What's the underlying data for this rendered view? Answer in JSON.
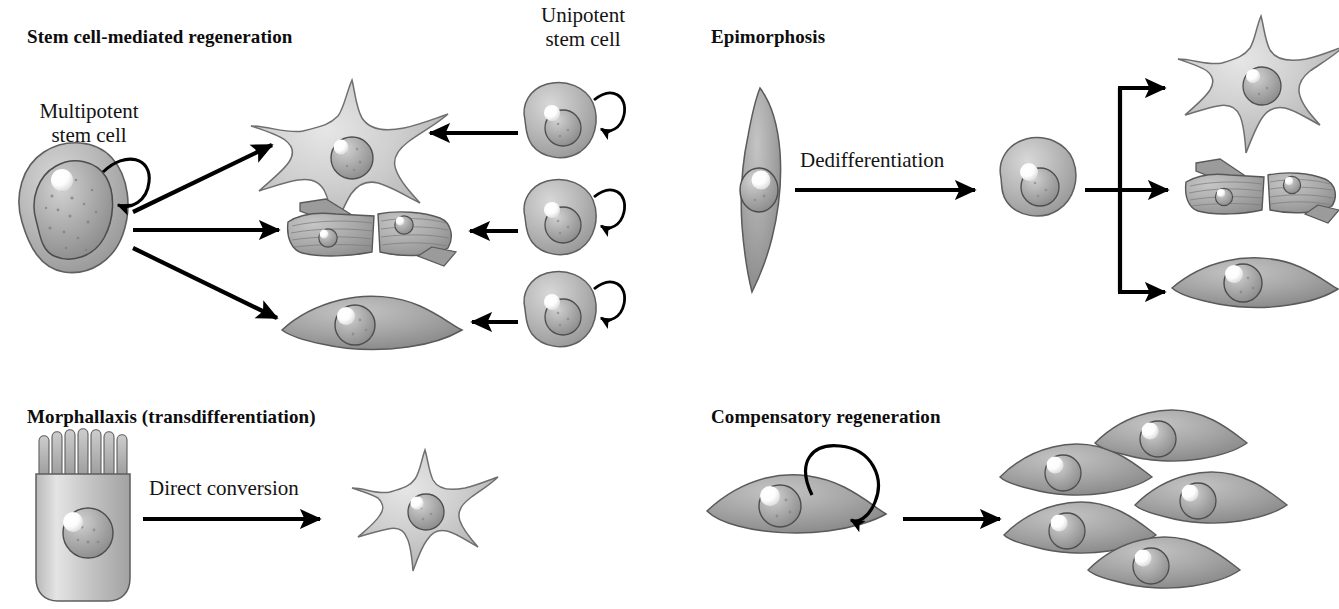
{
  "figure": {
    "type": "biological-schematic",
    "title_visible": false,
    "background_color": "#ffffff",
    "panel_count": 4
  },
  "panels": [
    {
      "id": "stem-cell-mediated-regeneration",
      "heading": "Stem cell-mediated regeneration",
      "labels": [
        {
          "id": "multipotent",
          "text_line1": "Multipotent",
          "text_line2": "stem cell"
        },
        {
          "id": "unipotent",
          "text_line1": "Unipotent",
          "text_line2": "stem cell"
        }
      ],
      "source_cell": {
        "name": "multipotent stem cell",
        "shape": "round",
        "self_renewal_arrow": true
      },
      "output_cells": [
        {
          "name": "neuron",
          "shape": "star"
        },
        {
          "name": "muscle fiber",
          "shape": "striated-fibers"
        },
        {
          "name": "fibroblast",
          "shape": "spindle"
        }
      ],
      "input_cells": [
        {
          "name": "unipotent stem cell",
          "shape": "round",
          "self_renewal_arrow": true
        },
        {
          "name": "unipotent stem cell",
          "shape": "round",
          "self_renewal_arrow": true
        },
        {
          "name": "unipotent stem cell",
          "shape": "round",
          "self_renewal_arrow": true
        }
      ],
      "arrow_count": 6
    },
    {
      "id": "epimorphosis",
      "heading": "Epimorphosis",
      "labels": [
        {
          "id": "dedifferentiation",
          "text_line1": "Dedifferentiation",
          "text_line2": ""
        }
      ],
      "source_cell": {
        "name": "differentiated elongated cell",
        "shape": "vertical-spindle",
        "self_renewal_arrow": false
      },
      "intermediate_cell": {
        "name": "dedifferentiated cell",
        "shape": "round"
      },
      "output_cells": [
        {
          "name": "neuron",
          "shape": "star"
        },
        {
          "name": "muscle fiber",
          "shape": "striated-fibers"
        },
        {
          "name": "fibroblast",
          "shape": "spindle"
        }
      ],
      "arrow_count": 5
    },
    {
      "id": "morphallaxis",
      "heading": "Morphallaxis (transdifferentiation)",
      "labels": [
        {
          "id": "direct-conversion",
          "text_line1": "Direct conversion",
          "text_line2": ""
        }
      ],
      "source_cell": {
        "name": "columnar epithelial cell",
        "shape": "columnar-with-microvilli",
        "microvilli_count": 8
      },
      "output_cells": [
        {
          "name": "neuron",
          "shape": "star"
        }
      ],
      "arrow_count": 1
    },
    {
      "id": "compensatory-regeneration",
      "heading": "Compensatory regeneration",
      "labels": [],
      "source_cell": {
        "name": "differentiated fibroblast",
        "shape": "spindle",
        "self_renewal_arrow": true
      },
      "output_cells": [
        {
          "name": "fibroblast",
          "shape": "spindle"
        },
        {
          "name": "fibroblast",
          "shape": "spindle"
        },
        {
          "name": "fibroblast",
          "shape": "spindle"
        },
        {
          "name": "fibroblast",
          "shape": "spindle"
        },
        {
          "name": "fibroblast",
          "shape": "spindle"
        },
        {
          "name": "fibroblast",
          "shape": "spindle"
        }
      ],
      "arrow_count": 1,
      "output_cell_count": 6
    }
  ],
  "colors": {
    "background": "#ffffff",
    "text": "#111111",
    "arrow": "#000000",
    "cell_light_fill": "#c9c9c9",
    "cell_light_stroke": "#6b6b6b",
    "cell_mid_fill": "#b0b0b0",
    "cell_dark_fill": "#989898",
    "cell_dark_stroke": "#585858",
    "nucleus_fill": "#a3a3a3",
    "nucleus_stroke": "#4f4f4f",
    "highlight": "#ffffff",
    "muscle_fill": "#a9a9a9",
    "muscle_stroke": "#555555"
  }
}
